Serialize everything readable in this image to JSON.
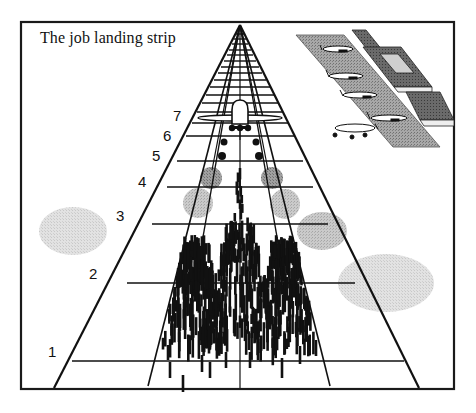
{
  "diagram": {
    "title": "The job landing strip",
    "rung_labels": [
      {
        "label": "1",
        "x": 48,
        "y": 343
      },
      {
        "label": "2",
        "x": 89,
        "y": 265
      },
      {
        "label": "3",
        "x": 116,
        "y": 207
      },
      {
        "label": "4",
        "x": 138,
        "y": 173
      },
      {
        "label": "5",
        "x": 152,
        "y": 147
      },
      {
        "label": "6",
        "x": 163,
        "y": 127
      },
      {
        "label": "7",
        "x": 173,
        "y": 107
      }
    ],
    "colors": {
      "ink": "#111111",
      "frame": "#1a1a1a",
      "cloud_light": "#dcdcdc",
      "cloud_mid": "#c4c4c4",
      "cloud_dark": "#8f8f8f",
      "apron": "#9a9a9a",
      "terminal_dark": "#555555",
      "terminal_light": "#d8d8d8",
      "background": "#ffffff"
    },
    "elements": {
      "runway": "perspective runway grid converging to horizon",
      "airplane": "aircraft landing on runway",
      "landing_marks": "dense vertical tick marks representing job applications",
      "clouds": "grey stippled circles/ellipses",
      "terminal": "airport terminal with parked airplanes on apron"
    }
  }
}
